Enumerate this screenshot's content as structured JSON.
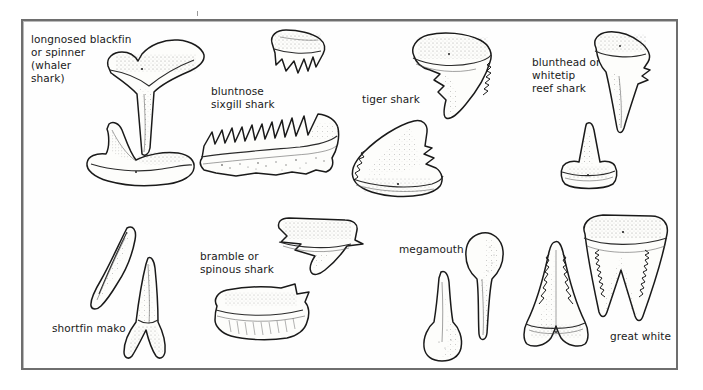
{
  "plate": {
    "title": "Shark teeth identification plate",
    "description": "Line-drawn illustrations of shark teeth specimens with species labels inside a ruled frame",
    "frame_color": "#6e6e6e",
    "background_color": "#ffffff",
    "ink_color": "#1a1a1a"
  },
  "specimens": [
    {
      "id": "longnosed-blackfin",
      "label": "longnosed blackfin\nor spinner\n(whaler\nshark)",
      "label_x": 31,
      "label_y": 33,
      "views": 2
    },
    {
      "id": "bluntnose-sixgill",
      "label": "bluntnose\nsixgill shark",
      "label_x": 211,
      "label_y": 85,
      "views": 2
    },
    {
      "id": "tiger-shark",
      "label": "tiger shark",
      "label_x": 362,
      "label_y": 93,
      "views": 2
    },
    {
      "id": "blunthead-whitetip-reef",
      "label": "blunthead or\nwhitetip\nreef shark",
      "label_x": 532,
      "label_y": 56,
      "views": 2
    },
    {
      "id": "shortfin-mako",
      "label": "shortfin mako",
      "label_x": 52,
      "label_y": 322,
      "views": 2
    },
    {
      "id": "bramble-spinous",
      "label": "bramble or\nspinous shark",
      "label_x": 200,
      "label_y": 250,
      "views": 2
    },
    {
      "id": "megamouth",
      "label": "megamouth",
      "label_x": 399,
      "label_y": 243,
      "views": 2
    },
    {
      "id": "great-white",
      "label": "great white",
      "label_x": 610,
      "label_y": 330,
      "views": 2
    }
  ]
}
